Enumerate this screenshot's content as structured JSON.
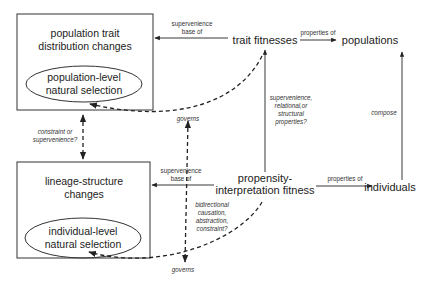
{
  "diagram": {
    "nodes": {
      "top_box": {
        "line1": "population trait",
        "line2": "distribution changes",
        "ellipse_line1": "population-level",
        "ellipse_line2": "natural selection"
      },
      "bottom_box": {
        "line1": "lineage-structure",
        "line2": "changes",
        "ellipse_line1": "individual-level",
        "ellipse_line2": "natural selection"
      },
      "trait_fitnesses": "trait fitnesses",
      "populations": "populations",
      "propensity_line1": "propensity-",
      "propensity_line2": "interpretation fitness",
      "individuals": "individuals"
    },
    "edge_labels": {
      "top_supervenience_1": "supervenience",
      "top_supervenience_2": "base of",
      "top_properties_of": "properties of",
      "bottom_supervenience_1": "supervenience",
      "bottom_supervenience_2": "base of",
      "bottom_properties_of": "properties of",
      "compose": "compose",
      "relational_1": "supervenience,",
      "relational_2": "relational,or",
      "relational_3": "structural",
      "relational_4": "properties?",
      "constraint_1": "constraint or",
      "constraint_2": "supervenience?",
      "governs_top": "governs",
      "governs_bottom": "governs",
      "bidirectional_1": "bidirectional",
      "bidirectional_2": "causation,",
      "bidirectional_3": "abstraction,",
      "bidirectional_4": "constraint?"
    }
  }
}
